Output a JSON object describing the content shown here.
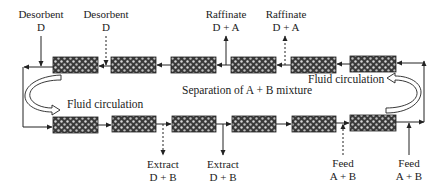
{
  "diagram": {
    "type": "simulated-moving-bed",
    "center_label": "Separation of A + B mixture",
    "circulation_labels": {
      "left": "Fluid circulation",
      "right": "Fluid circulation"
    },
    "top_labels": [
      {
        "name": "Desorbent",
        "stream": "D",
        "line": "solid",
        "direction": "in"
      },
      {
        "name": "Desorbent",
        "stream": "D",
        "line": "dashed",
        "direction": "in"
      },
      {
        "name": "Raffinate",
        "stream": "D + A",
        "line": "solid",
        "direction": "out"
      },
      {
        "name": "Raffinate",
        "stream": "D + A",
        "line": "dashed",
        "direction": "out"
      }
    ],
    "bottom_labels": [
      {
        "name": "Extract",
        "stream": "D + B",
        "line": "dashed",
        "direction": "out"
      },
      {
        "name": "Extract",
        "stream": "D + B",
        "line": "solid",
        "direction": "out"
      },
      {
        "name": "Feed",
        "stream": "A + B",
        "line": "dashed",
        "direction": "in"
      },
      {
        "name": "Feed",
        "stream": "A + B",
        "line": "solid",
        "direction": "in"
      }
    ],
    "columns_top": 6,
    "columns_bottom": 6,
    "colors": {
      "line": "#222222",
      "column_fill": "#3a3a3a",
      "column_dot": "#d8d8d8"
    }
  }
}
